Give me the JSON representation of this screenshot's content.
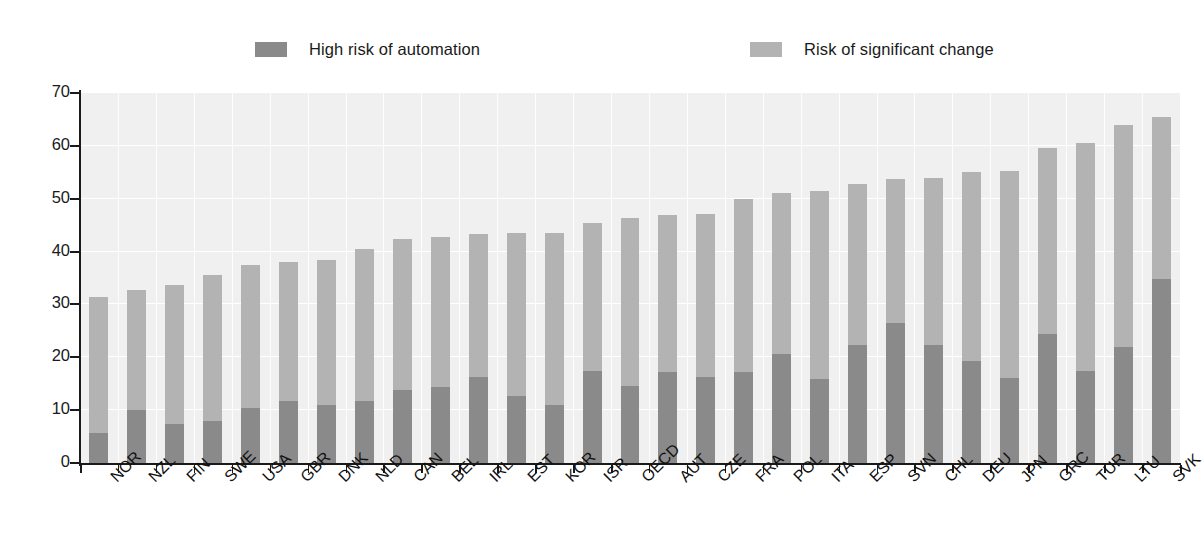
{
  "chart_data": {
    "type": "bar",
    "stacked": true,
    "title": "",
    "subtitle": "",
    "xlabel": "",
    "ylabel": "",
    "ylim": [
      0,
      70
    ],
    "yticks": [
      0,
      10,
      20,
      30,
      40,
      50,
      60,
      70
    ],
    "ytick_labels": [
      "0",
      "10",
      "20",
      "30",
      "40",
      "50",
      "60",
      "70"
    ],
    "grid": true,
    "legend_position": "top",
    "categories": [
      "NOR",
      "NZL",
      "FIN",
      "SWE",
      "USA",
      "GBR",
      "DNK",
      "NLD",
      "CAN",
      "BEL",
      "IRL",
      "EST",
      "KOR",
      "ISR",
      "OECD",
      "AUT",
      "CZE",
      "FRA",
      "POL",
      "ITA",
      "ESP",
      "SVN",
      "CHL",
      "DEU",
      "JPN",
      "GRC",
      "TUR",
      "LTU",
      "SVK"
    ],
    "series": [
      {
        "name": "High risk of automation",
        "color": "#8a8a8a",
        "values": [
          5.7,
          10.1,
          7.4,
          8.0,
          10.4,
          11.8,
          10.9,
          11.7,
          13.9,
          14.3,
          16.3,
          12.7,
          10.9,
          17.4,
          14.5,
          17.2,
          16.2,
          17.3,
          20.6,
          15.9,
          22.4,
          26.4,
          22.4,
          19.3,
          16.1,
          24.4,
          17.4,
          22.0,
          34.9
        ]
      },
      {
        "name": "Risk of significant change",
        "color": "#b3b3b3",
        "values": [
          25.8,
          22.7,
          26.3,
          27.6,
          27.1,
          26.2,
          27.6,
          28.7,
          28.4,
          28.5,
          27.0,
          30.8,
          32.7,
          28.0,
          31.8,
          29.7,
          31.0,
          32.6,
          30.4,
          35.5,
          30.3,
          27.4,
          31.5,
          35.7,
          39.2,
          35.2,
          43.1,
          42.0,
          30.5
        ]
      }
    ],
    "totals": [
      31.5,
      32.8,
      33.7,
      35.6,
      37.5,
      38.0,
      38.5,
      40.4,
      42.3,
      42.8,
      43.3,
      43.5,
      43.6,
      45.4,
      46.3,
      46.9,
      47.2,
      49.9,
      51.0,
      51.4,
      52.7,
      53.8,
      53.9,
      55.0,
      55.3,
      59.6,
      60.5,
      64.0,
      65.4
    ]
  },
  "legend": {
    "items": [
      {
        "label": "High risk of automation",
        "color": "#8a8a8a"
      },
      {
        "label": "Risk of significant change",
        "color": "#b3b3b3"
      }
    ]
  },
  "axes": {
    "y": {
      "labels": [
        "70",
        "60",
        "50",
        "40",
        "30",
        "20",
        "10",
        "0"
      ]
    }
  }
}
